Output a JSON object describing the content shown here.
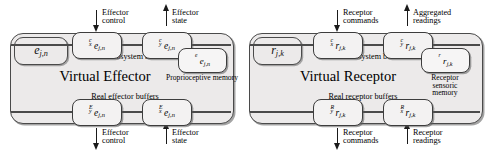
{
  "diagram": {
    "blocks": [
      {
        "id": "effector",
        "tab_label": "e j,n",
        "title": "Virtual Effector",
        "caption_top": "Control subsystem buffers",
        "caption_bottom": "Real effector buffers",
        "memory": {
          "expr_sup": "e",
          "expr_sub": "",
          "expr_base": "e",
          "expr_post": "j,n",
          "caption": "Proprioceptive memory"
        },
        "buffers": [
          {
            "sup": "c",
            "sub": "x",
            "base": "e",
            "post": "j,n"
          },
          {
            "sup": "c",
            "sub": "y",
            "base": "e",
            "post": "j,n"
          },
          {
            "sup": "E",
            "sub": "y",
            "base": "e",
            "post": "j,n"
          },
          {
            "sup": "E",
            "sub": "x",
            "base": "e",
            "post": "j,n"
          }
        ],
        "arrows": [
          {
            "direction": "down",
            "label_line1": "Effector",
            "label_line2": "control",
            "position": "top-left"
          },
          {
            "direction": "up",
            "label_line1": "Effector",
            "label_line2": "state",
            "position": "top-right"
          },
          {
            "direction": "down",
            "label_line1": "Effector",
            "label_line2": "control",
            "position": "bottom-left"
          },
          {
            "direction": "up",
            "label_line1": "Effector",
            "label_line2": "state",
            "position": "bottom-right"
          }
        ]
      },
      {
        "id": "receptor",
        "tab_label": "r j,k",
        "title": "Virtual Receptor",
        "caption_top": "Control subsystem buffers",
        "caption_bottom": "Real receptor buffers",
        "memory": {
          "expr_sup": "r",
          "expr_sub": "",
          "expr_base": "r",
          "expr_post": "j,k",
          "caption": "Receptor sensoric memory"
        },
        "buffers": [
          {
            "sup": "c",
            "sub": "x",
            "base": "r",
            "post": "j,k"
          },
          {
            "sup": "c",
            "sub": "y",
            "base": "r",
            "post": "j,k"
          },
          {
            "sup": "R",
            "sub": "y",
            "base": "r",
            "post": "j,k"
          },
          {
            "sup": "R",
            "sub": "x",
            "base": "r",
            "post": "j,k"
          }
        ],
        "arrows": [
          {
            "direction": "down",
            "label_line1": "Receptor",
            "label_line2": "commands",
            "position": "top-left"
          },
          {
            "direction": "up",
            "label_line1": "Aggregated",
            "label_line2": "readings",
            "position": "top-right"
          },
          {
            "direction": "down",
            "label_line1": "Receptor",
            "label_line2": "commands",
            "position": "bottom-left"
          },
          {
            "direction": "up",
            "label_line1": "Receptor",
            "label_line2": "readings",
            "position": "bottom-right"
          }
        ]
      }
    ],
    "colors": {
      "block_fill": "#eceaea",
      "buffer_fill": "#f3f2f2",
      "stroke": "#4a4a4a",
      "text": "#000000",
      "background": "#ffffff"
    }
  }
}
